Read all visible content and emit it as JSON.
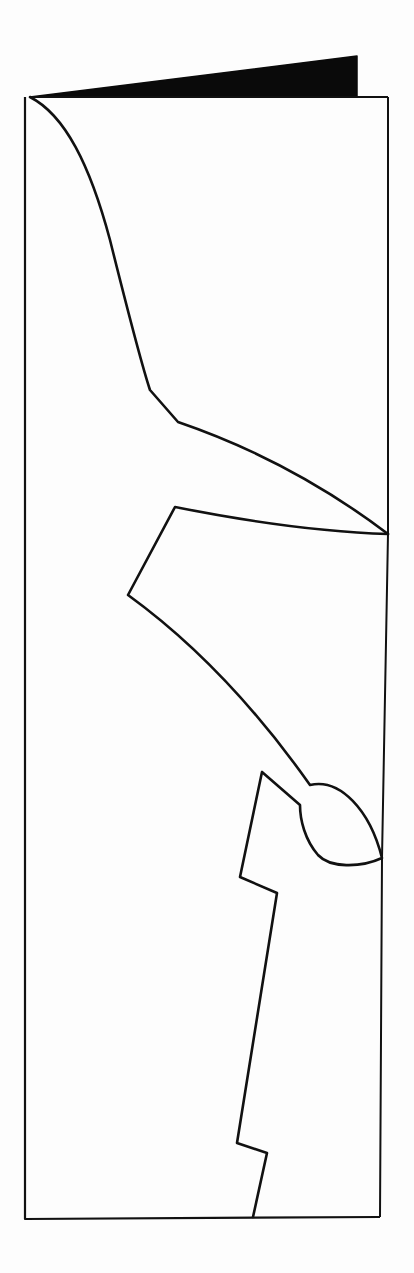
{
  "diagram": {
    "title": "",
    "colors": {
      "background": "#fdfdfd",
      "stroke": "#111111",
      "fold_fill": "#0a0a0a"
    },
    "canvas": {
      "width": 414,
      "height": 1273
    },
    "shapes": {
      "fold_flap": "M 30 97 L 357 56 L 357 97 Z",
      "page_outline": "M 30 97 L 388 97 L 388 534 M 383 540 L 380 1217 L 25 1219 L 25 97",
      "page_right_edge": "M 388 97 L 388 534 L 382 858 L 380 1217",
      "cut_upper": "M 30 97 C 65 115, 90 165, 110 240 C 125 300, 140 360, 150 390 L 178 422 C 260 450, 330 490, 388 534",
      "cut_middle": "M 388 534 C 320 532, 240 520, 175 507 L 128 595 C 190 640, 250 700, 310 785 C 340 778, 370 810, 382 858 C 360 868, 330 868, 318 855 C 305 840, 300 820, 300 805 L 262 772 L 240 877 L 277 893 L 237 1143 L 267 1153 L 253 1217"
    }
  }
}
